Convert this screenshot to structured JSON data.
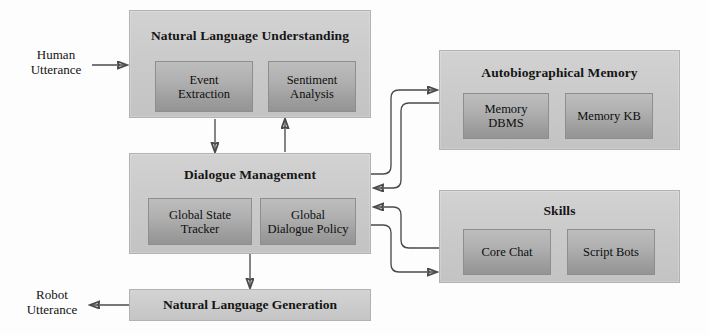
{
  "diagram": {
    "colors": {
      "module_fill": "#c9c9c9",
      "sub_fill": "#a8a8a8",
      "module_border": "#b2b2b2",
      "sub_border": "#8e8e8e",
      "connector": "#4a4a4a",
      "background": "#fdfdfd",
      "text": "#121212"
    },
    "external_labels": {
      "human_utterance": "Human\nUtterance",
      "human_utterance_line1": "Human",
      "human_utterance_line2": "Utterance",
      "robot_utterance_line1": "Robot",
      "robot_utterance_line2": "Utterance"
    },
    "modules": [
      {
        "id": "nlu",
        "title": "Natural Language Understanding",
        "children": [
          {
            "id": "event-extraction",
            "line1": "Event",
            "line2": "Extraction"
          },
          {
            "id": "sentiment-analysis",
            "line1": "Sentiment",
            "line2": "Analysis"
          }
        ]
      },
      {
        "id": "dialogue-management",
        "title": "Dialogue Management",
        "children": [
          {
            "id": "global-state-tracker",
            "line1": "Global State",
            "line2": "Tracker"
          },
          {
            "id": "global-dialogue-policy",
            "line1": "Global",
            "line2": "Dialogue Policy"
          }
        ]
      },
      {
        "id": "autobiographical-memory",
        "title": "Autobiographical Memory",
        "children": [
          {
            "id": "memory-dbms",
            "line1": "Memory",
            "line2": "DBMS"
          },
          {
            "id": "memory-kb",
            "line1": "Memory KB",
            "line2": ""
          }
        ]
      },
      {
        "id": "skills",
        "title": "Skills",
        "children": [
          {
            "id": "core-chat",
            "line1": "Core Chat",
            "line2": ""
          },
          {
            "id": "script-bots",
            "line1": "Script Bots",
            "line2": ""
          }
        ]
      },
      {
        "id": "nlg",
        "title": "Natural Language Generation",
        "children": []
      }
    ],
    "connections": [
      {
        "id": "human-to-nlu",
        "from": "Human Utterance",
        "to": "Natural Language Understanding"
      },
      {
        "id": "nlu-to-dm",
        "from": "Natural Language Understanding",
        "to": "Dialogue Management"
      },
      {
        "id": "dm-to-nlu",
        "from": "Dialogue Management",
        "to": "Natural Language Understanding"
      },
      {
        "id": "dm-to-memory",
        "from": "Dialogue Management",
        "to": "Autobiographical Memory"
      },
      {
        "id": "memory-to-dm",
        "from": "Autobiographical Memory",
        "to": "Dialogue Management"
      },
      {
        "id": "skills-to-dm",
        "from": "Skills",
        "to": "Dialogue Management"
      },
      {
        "id": "dm-to-skills",
        "from": "Dialogue Management",
        "to": "Skills"
      },
      {
        "id": "dm-to-nlg",
        "from": "Dialogue Management",
        "to": "Natural Language Generation"
      },
      {
        "id": "nlg-to-robot",
        "from": "Natural Language Generation",
        "to": "Robot Utterance"
      }
    ]
  }
}
